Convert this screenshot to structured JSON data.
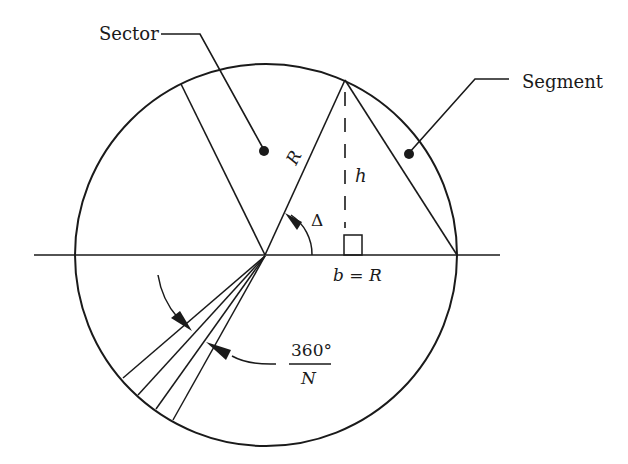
{
  "diagram": {
    "labels": {
      "sector": "Sector",
      "segment": "Segment",
      "radius": "R",
      "height": "h",
      "angle": "Δ",
      "base": "b = R",
      "fan_numerator": "360°",
      "fan_denominator": "N"
    },
    "colors": {
      "stroke": "#1a1a1a",
      "background": "#ffffff"
    },
    "geometry": {
      "circle_center": [
        265,
        255
      ],
      "circle_radius": 192,
      "axis_y": 255,
      "apex": [
        345,
        80
      ],
      "fan_line_count": 4
    }
  }
}
